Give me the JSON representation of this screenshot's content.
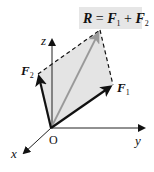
{
  "diagram": {
    "equation": {
      "R": "R",
      "eq": " = ",
      "F1": "F",
      "sub1": "1",
      "plus": " + ",
      "F2": "F",
      "sub2": "2"
    },
    "labels": {
      "F1": "F",
      "F1_sub": "1",
      "F2": "F",
      "F2_sub": "2",
      "origin": "O",
      "x_axis": "x",
      "y_axis": "y",
      "z_axis": "z"
    },
    "colors": {
      "vector": "#111111",
      "resultant": "#999999",
      "parallelogram_fill": "#e4e4e4",
      "label_box": "#e6e6e6",
      "axis": "#222222"
    }
  }
}
